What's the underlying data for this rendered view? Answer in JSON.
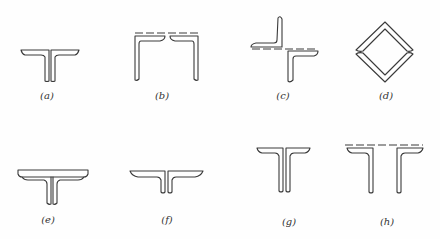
{
  "figure": {
    "stroke_color": "#3a3a3a",
    "panels": [
      {
        "id": "a",
        "label": "(a)",
        "shape": "double-angle tee, short flanges, back-to-back"
      },
      {
        "id": "b",
        "label": "(b)",
        "shape": "two angles forming open box with dashed top plate line"
      },
      {
        "id": "c",
        "label": "(c)",
        "shape": "two angles in starred/cross arrangement with dashed line"
      },
      {
        "id": "d",
        "label": "(d)",
        "shape": "four angles forming diamond box"
      },
      {
        "id": "e",
        "label": "(e)",
        "shape": "double-angle tee with cover plate on top"
      },
      {
        "id": "f",
        "label": "(f)",
        "shape": "double-angle tee, long flanges, short webs"
      },
      {
        "id": "g",
        "label": "(g)",
        "shape": "double-angle tee, long webs"
      },
      {
        "id": "h",
        "label": "(h)",
        "shape": "two separated angles with dashed connecting line"
      }
    ]
  }
}
